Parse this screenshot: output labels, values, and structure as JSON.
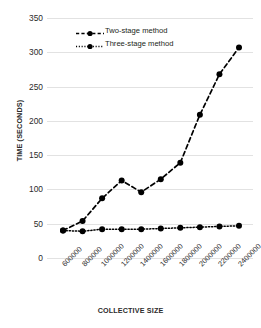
{
  "chart_data": {
    "type": "line",
    "title": "",
    "xlabel": "COLLECTIVE SIZE",
    "ylabel": "TIME (SECONDS)",
    "categories": [
      "600000",
      "800000",
      "1000000",
      "1200000",
      "1400000",
      "1600000",
      "1800000",
      "2000000",
      "2200000",
      "2400000"
    ],
    "yticks": [
      "0",
      "50",
      "100",
      "150",
      "200",
      "250",
      "300",
      "350"
    ],
    "ylim": [
      0,
      350
    ],
    "grid": true,
    "legend_position": "top-center",
    "series": [
      {
        "name": "Two-stage method",
        "style": "dashed",
        "marker": "filled-circle",
        "color": "#000000",
        "values": [
          40,
          54,
          87,
          113,
          96,
          115,
          139,
          209,
          268,
          307
        ]
      },
      {
        "name": "Three-stage method",
        "style": "dotted",
        "marker": "filled-circle",
        "color": "#000000",
        "values": [
          40,
          39,
          42,
          42,
          42,
          43,
          44,
          45,
          46,
          47
        ]
      }
    ]
  },
  "legend": {
    "items": [
      {
        "label": "Two-stage method"
      },
      {
        "label": "Three-stage method"
      }
    ]
  },
  "axes": {
    "y_title": "TIME (SECONDS)",
    "x_title": "COLLECTIVE SIZE"
  }
}
